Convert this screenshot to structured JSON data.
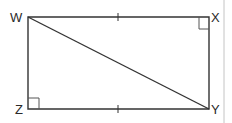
{
  "diagram": {
    "type": "rectangle-with-diagonal",
    "vertices": [
      {
        "label": "W",
        "x": 28,
        "y": 17
      },
      {
        "label": "X",
        "x": 209,
        "y": 17
      },
      {
        "label": "Y",
        "x": 209,
        "y": 109
      },
      {
        "label": "Z",
        "x": 28,
        "y": 109
      }
    ],
    "segments": [
      "WX",
      "XY",
      "YZ",
      "ZW",
      "WY"
    ],
    "right_angles": [
      "X",
      "Z"
    ],
    "congruent_ticks": [
      "WX",
      "ZY"
    ],
    "colors": {
      "stroke": "#333333",
      "border": "#bbbbbb"
    }
  }
}
